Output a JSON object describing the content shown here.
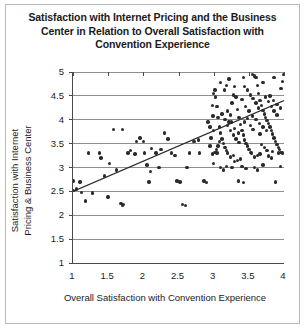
{
  "chart_data": {
    "type": "scatter",
    "title": "Satisfaction with Internet Pricing and the Business\nCenter in Relation to Overall Satisfaction with\nConvention Experience",
    "xlabel": "Overall Satisfaction with Convention Experience",
    "ylabel": "Satisfaction with Internet\nPricing & Business Center",
    "xlim": [
      1,
      4
    ],
    "ylim": [
      1,
      5
    ],
    "xticks": [
      1,
      1.5,
      2,
      2.5,
      3,
      3.5,
      4
    ],
    "xtick_labels": [
      "1",
      "1.5",
      "2",
      "2.5",
      "3",
      "3.5",
      "4"
    ],
    "yticks": [
      1,
      1.5,
      2,
      2.5,
      3,
      3.5,
      4,
      4.5,
      5
    ],
    "ytick_labels": [
      "1",
      "1.5",
      "2",
      "2.5",
      "3",
      "3.5",
      "4",
      "4.5",
      "5"
    ],
    "grid": "horizontal",
    "grid_color": "#8e8e8e",
    "legend": "none",
    "marker_color": "#2b2b2b",
    "marker_size": 3.4,
    "trendline": {
      "type": "linear-fit",
      "color": "#2b2b2b",
      "x_start": 1.0,
      "y_start": 2.5,
      "x_end": 4.0,
      "y_end": 4.4
    },
    "points": [
      [
        1.0,
        2.72
      ],
      [
        1.0,
        2.52
      ],
      [
        1.05,
        2.55
      ],
      [
        1.1,
        2.7
      ],
      [
        1.12,
        2.48
      ],
      [
        1.18,
        2.3
      ],
      [
        1.22,
        3.3
      ],
      [
        1.38,
        3.3
      ],
      [
        1.4,
        3.2
      ],
      [
        1.45,
        2.82
      ],
      [
        1.28,
        2.47
      ],
      [
        1.5,
        2.38
      ],
      [
        1.58,
        3.8
      ],
      [
        1.7,
        3.8
      ],
      [
        1.52,
        3.08
      ],
      [
        1.62,
        2.95
      ],
      [
        1.68,
        2.25
      ],
      [
        1.72,
        2.22
      ],
      [
        1.7,
        2.2
      ],
      [
        1.78,
        3.3
      ],
      [
        1.82,
        3.35
      ],
      [
        1.88,
        3.28
      ],
      [
        1.9,
        3.55
      ],
      [
        1.95,
        3.62
      ],
      [
        2.0,
        3.55
      ],
      [
        2.02,
        3.3
      ],
      [
        2.05,
        3.05
      ],
      [
        2.08,
        2.7
      ],
      [
        2.1,
        2.92
      ],
      [
        2.12,
        3.4
      ],
      [
        2.18,
        3.3
      ],
      [
        2.22,
        3.0
      ],
      [
        2.25,
        3.38
      ],
      [
        2.3,
        3.72
      ],
      [
        2.35,
        3.6
      ],
      [
        2.4,
        3.3
      ],
      [
        2.45,
        3.25
      ],
      [
        2.48,
        2.72
      ],
      [
        2.52,
        2.7
      ],
      [
        2.56,
        2.22
      ],
      [
        2.6,
        2.2
      ],
      [
        2.62,
        3.0
      ],
      [
        2.66,
        3.3
      ],
      [
        2.72,
        3.55
      ],
      [
        2.78,
        3.58
      ],
      [
        2.8,
        3.3
      ],
      [
        2.86,
        2.72
      ],
      [
        2.9,
        2.68
      ],
      [
        2.92,
        3.95
      ],
      [
        2.95,
        3.85
      ],
      [
        2.98,
        4.3
      ],
      [
        3.0,
        4.55
      ],
      [
        3.02,
        4.62
      ],
      [
        3.05,
        4.28
      ],
      [
        3.06,
        4.05
      ],
      [
        3.08,
        3.85
      ],
      [
        3.1,
        3.72
      ],
      [
        3.12,
        3.6
      ],
      [
        3.14,
        3.5
      ],
      [
        3.16,
        3.42
      ],
      [
        3.18,
        3.35
      ],
      [
        3.2,
        3.3
      ],
      [
        3.22,
        3.95
      ],
      [
        3.24,
        4.1
      ],
      [
        3.26,
        4.35
      ],
      [
        3.28,
        4.52
      ],
      [
        3.3,
        4.7
      ],
      [
        3.32,
        4.48
      ],
      [
        3.34,
        4.22
      ],
      [
        3.36,
        4.05
      ],
      [
        3.38,
        3.9
      ],
      [
        3.4,
        3.78
      ],
      [
        3.42,
        3.68
      ],
      [
        3.44,
        3.58
      ],
      [
        3.46,
        3.5
      ],
      [
        3.48,
        3.45
      ],
      [
        3.5,
        3.38
      ],
      [
        3.52,
        3.32
      ],
      [
        3.54,
        3.3
      ],
      [
        3.55,
        4.95
      ],
      [
        3.58,
        4.92
      ],
      [
        3.6,
        4.88
      ],
      [
        3.62,
        4.72
      ],
      [
        3.64,
        4.55
      ],
      [
        3.66,
        4.4
      ],
      [
        3.68,
        4.3
      ],
      [
        3.7,
        4.2
      ],
      [
        3.72,
        4.12
      ],
      [
        3.74,
        4.05
      ],
      [
        3.76,
        3.98
      ],
      [
        3.78,
        3.92
      ],
      [
        3.8,
        3.85
      ],
      [
        3.82,
        3.78
      ],
      [
        3.84,
        3.7
      ],
      [
        3.86,
        3.62
      ],
      [
        3.88,
        3.55
      ],
      [
        3.9,
        3.48
      ],
      [
        3.92,
        3.42
      ],
      [
        3.94,
        3.38
      ],
      [
        3.96,
        3.32
      ],
      [
        3.98,
        3.3
      ],
      [
        3.2,
        4.18
      ],
      [
        3.25,
        3.95
      ],
      [
        3.3,
        3.82
      ],
      [
        3.35,
        3.72
      ],
      [
        3.4,
        4.42
      ],
      [
        3.45,
        4.28
      ],
      [
        3.5,
        4.18
      ],
      [
        3.55,
        4.08
      ],
      [
        3.6,
        4.0
      ],
      [
        3.65,
        3.92
      ],
      [
        3.7,
        3.85
      ],
      [
        3.75,
        3.78
      ],
      [
        3.8,
        4.5
      ],
      [
        3.85,
        4.4
      ],
      [
        3.9,
        4.32
      ],
      [
        3.95,
        4.25
      ],
      [
        4.0,
        4.95
      ],
      [
        3.98,
        4.8
      ],
      [
        3.96,
        4.65
      ],
      [
        3.12,
        4.12
      ],
      [
        3.16,
        4.0
      ],
      [
        3.2,
        3.88
      ],
      [
        3.24,
        3.78
      ],
      [
        3.28,
        3.68
      ],
      [
        3.32,
        3.6
      ],
      [
        3.36,
        3.52
      ],
      [
        3.15,
        4.62
      ],
      [
        3.18,
        4.72
      ],
      [
        3.44,
        4.7
      ],
      [
        3.48,
        4.62
      ],
      [
        3.52,
        4.52
      ],
      [
        3.56,
        4.45
      ],
      [
        3.6,
        4.35
      ],
      [
        3.64,
        4.25
      ],
      [
        3.05,
        3.3
      ],
      [
        3.1,
        3.0
      ],
      [
        3.14,
        2.95
      ],
      [
        3.18,
        3.02
      ],
      [
        3.26,
        3.0
      ],
      [
        3.4,
        3.02
      ],
      [
        3.46,
        2.98
      ],
      [
        3.58,
        3.0
      ],
      [
        3.62,
        2.95
      ],
      [
        3.7,
        3.05
      ],
      [
        3.35,
        2.72
      ],
      [
        3.42,
        2.68
      ],
      [
        3.88,
        2.7
      ],
      [
        3.95,
        3.02
      ],
      [
        3.0,
        3.08
      ],
      [
        2.98,
        3.28
      ],
      [
        3.02,
        3.32
      ],
      [
        3.04,
        3.38
      ],
      [
        3.06,
        3.45
      ],
      [
        3.08,
        3.55
      ],
      [
        3.44,
        3.95
      ],
      [
        3.48,
        4.02
      ],
      [
        3.52,
        3.88
      ],
      [
        3.56,
        3.8
      ],
      [
        3.66,
        3.7
      ],
      [
        3.74,
        4.48
      ],
      [
        3.78,
        4.38
      ],
      [
        3.82,
        4.28
      ],
      [
        3.86,
        4.18
      ],
      [
        3.9,
        4.1
      ],
      [
        3.68,
        3.48
      ],
      [
        3.72,
        3.42
      ],
      [
        3.76,
        3.36
      ],
      [
        3.84,
        3.34
      ],
      [
        3.92,
        3.3
      ],
      [
        3.3,
        3.12
      ],
      [
        3.34,
        3.15
      ],
      [
        3.38,
        3.18
      ],
      [
        3.24,
        3.22
      ],
      [
        3.28,
        3.25
      ],
      [
        3.58,
        3.22
      ],
      [
        3.62,
        3.25
      ],
      [
        3.66,
        3.28
      ],
      [
        3.78,
        3.24
      ],
      [
        3.82,
        3.2
      ],
      [
        3.1,
        4.78
      ],
      [
        3.22,
        4.85
      ],
      [
        3.42,
        4.88
      ],
      [
        3.7,
        4.78
      ],
      [
        3.86,
        4.88
      ],
      [
        2.95,
        3.45
      ],
      [
        2.96,
        3.62
      ],
      [
        3.0,
        3.78
      ],
      [
        2.99,
        4.08
      ],
      [
        3.03,
        4.48
      ]
    ]
  }
}
